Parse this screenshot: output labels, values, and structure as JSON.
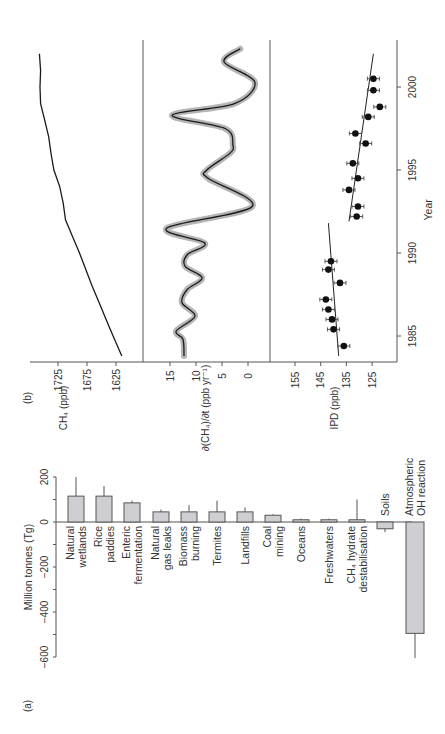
{
  "figure": {
    "panel_a_label": "(a)",
    "panel_b_label": "(b)",
    "orientation": "rotated 90 degrees counter-clockwise"
  },
  "chart_data": [
    {
      "type": "bar",
      "panel": "(a)",
      "title": "",
      "xlabel": "",
      "ylabel": "Million tonnes (Tg)",
      "ylim": [
        -600,
        200
      ],
      "yticks": [
        200,
        0,
        -200,
        -400,
        -600
      ],
      "grid": false,
      "categories": [
        "Natural wetlands",
        "Rice paddies",
        "Enteric fermentation",
        "Natural gas leaks",
        "Biomass burning",
        "Termites",
        "Landfills",
        "Coal mining",
        "Oceans",
        "Freshwaters",
        "CH4 hydrate destabilisation",
        "Soils",
        "Atmospheric OH reaction"
      ],
      "category_lines": [
        [
          "Natural",
          "wetlands"
        ],
        [
          "Rice",
          "paddies"
        ],
        [
          "Enteric",
          "fermentation"
        ],
        [
          "Natural",
          "gas leaks"
        ],
        [
          "Biomass",
          "burning"
        ],
        [
          "Termites"
        ],
        [
          "Landfills"
        ],
        [
          "Coal",
          "mining"
        ],
        [
          "Oceans"
        ],
        [
          "Freshwaters"
        ],
        [
          "CH₄ hydrate",
          "destabilisation"
        ],
        [
          "Soils"
        ],
        [
          "Atmospheric",
          "OH reaction"
        ]
      ],
      "values": [
        115,
        115,
        85,
        45,
        45,
        45,
        45,
        30,
        10,
        10,
        10,
        -30,
        -495
      ],
      "error_upper": [
        200,
        160,
        95,
        55,
        75,
        95,
        65,
        35,
        15,
        15,
        100,
        -30,
        -495
      ],
      "error_lower": [
        115,
        115,
        85,
        45,
        45,
        45,
        45,
        30,
        10,
        10,
        10,
        -45,
        -605
      ]
    },
    {
      "type": "line",
      "panel": "(b) top",
      "title": "",
      "xlabel": "Year",
      "ylabel": "CH₄ (ppb)",
      "xlim": [
        1983.5,
        2002.5
      ],
      "ylim": [
        1590,
        1770
      ],
      "yticks": [
        1625,
        1675,
        1725
      ],
      "xticks": [
        1985,
        1990,
        1995,
        2000
      ],
      "x": [
        1983.8,
        1985,
        1986,
        1987,
        1988,
        1989,
        1990,
        1991,
        1992,
        1993,
        1994,
        1995,
        1996,
        1997,
        1998,
        1999,
        2000,
        2001,
        2002
      ],
      "values": [
        1615,
        1630,
        1642,
        1654,
        1666,
        1677,
        1688,
        1700,
        1712,
        1716,
        1722,
        1732,
        1737,
        1741,
        1748,
        1755,
        1756,
        1755,
        1757
      ]
    },
    {
      "type": "line",
      "panel": "(b) middle",
      "title": "",
      "xlabel": "Year",
      "ylabel": "∂(CH₄)/∂t (ppb yr⁻¹)",
      "xlim": [
        1983.5,
        2002.5
      ],
      "ylim": [
        -3,
        18
      ],
      "yticks": [
        15,
        10,
        5,
        0
      ],
      "uncertainty_band": true,
      "x": [
        1983.8,
        1984.8,
        1985.3,
        1986.2,
        1987.0,
        1987.8,
        1988.5,
        1989.2,
        1989.9,
        1990.6,
        1991.5,
        1992.8,
        1994.5,
        1995.0,
        1996.0,
        1996.5,
        1997.5,
        1998.3,
        1999.0,
        2000.3,
        2001.5,
        2002.3
      ],
      "values": [
        12.3,
        12.5,
        13.8,
        10.2,
        12.7,
        11.7,
        8.8,
        12.1,
        11.7,
        8.3,
        15.6,
        -0.8,
        7.7,
        7.9,
        3.5,
        2.9,
        4.4,
        14.6,
        2.6,
        -1.3,
        4.6,
        1.5
      ]
    },
    {
      "type": "scatter",
      "panel": "(b) bottom",
      "title": "",
      "xlabel": "Year",
      "ylabel": "IPD (ppb)",
      "xlim": [
        1983.5,
        2002.5
      ],
      "ylim": [
        117,
        163
      ],
      "yticks": [
        155,
        145,
        135,
        125
      ],
      "xticks": [
        1985,
        1990,
        1995,
        2000
      ],
      "error_bars": "horizontal",
      "x": [
        1984.4,
        1985.4,
        1986.0,
        1986.6,
        1987.2,
        1988.2,
        1989.0,
        1989.5,
        1992.2,
        1992.8,
        1993.8,
        1994.5,
        1995.4,
        1996.6,
        1997.2,
        1998.2,
        1998.8,
        1999.8,
        2000.5
      ],
      "values": [
        136,
        140,
        140.6,
        142,
        143,
        137.5,
        142,
        141,
        131,
        130.5,
        134,
        130.5,
        132.5,
        127.5,
        131.5,
        126.5,
        122,
        124.5,
        124.5
      ],
      "trend_lines": [
        {
          "x": [
            1983.8,
            1991.8
          ],
          "values": [
            138,
            142
          ]
        },
        {
          "x": [
            1991.9,
            2002.0
          ],
          "values": [
            134,
            124.5
          ]
        }
      ]
    }
  ]
}
